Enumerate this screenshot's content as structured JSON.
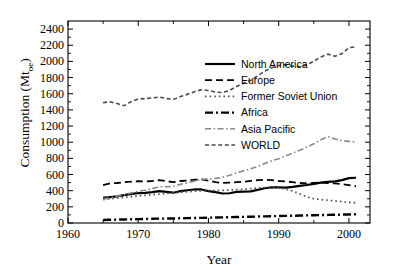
{
  "chart_data": {
    "type": "line",
    "title": "",
    "xlabel": "Year",
    "ylabel": "Consumption (Mtoe)",
    "ylabel_base": "Consumption (Mt",
    "ylabel_sub": "oe",
    "ylabel_close": ")",
    "xlim": [
      1960,
      2003
    ],
    "ylim": [
      0,
      2500
    ],
    "xticks": [
      1960,
      1970,
      1980,
      1990,
      2000
    ],
    "xticks_labels": [
      "1960",
      "1970",
      "1980",
      "1990",
      "2000"
    ],
    "xminor_step": 5,
    "yticks": [
      0,
      200,
      400,
      600,
      800,
      1000,
      1200,
      1400,
      1600,
      1800,
      2000,
      2200,
      2400
    ],
    "yticks_labels": [
      "0",
      "200",
      "400",
      "600",
      "800",
      "1000",
      "1200",
      "1400",
      "1600",
      "1800",
      "2000",
      "2200",
      "2400"
    ],
    "grid": false,
    "legend_position": "upper-right-inside",
    "x": [
      1965,
      1966,
      1967,
      1968,
      1969,
      1970,
      1971,
      1972,
      1973,
      1974,
      1975,
      1976,
      1977,
      1978,
      1979,
      1980,
      1981,
      1982,
      1983,
      1984,
      1985,
      1986,
      1987,
      1988,
      1989,
      1990,
      1991,
      1992,
      1993,
      1994,
      1995,
      1996,
      1997,
      1998,
      1999,
      2000,
      2001
    ],
    "series": [
      {
        "name": "North America",
        "style": "solid",
        "color": "#000000",
        "width": 2.2,
        "values": [
          310,
          320,
          330,
          345,
          360,
          370,
          372,
          382,
          395,
          385,
          375,
          395,
          405,
          415,
          415,
          395,
          382,
          365,
          368,
          385,
          388,
          392,
          410,
          430,
          440,
          440,
          438,
          448,
          460,
          470,
          485,
          500,
          510,
          515,
          530,
          555,
          560
        ]
      },
      {
        "name": "Europe",
        "style": "dashed",
        "color": "#000000",
        "width": 1.8,
        "values": [
          470,
          490,
          495,
          505,
          512,
          518,
          515,
          520,
          530,
          518,
          505,
          520,
          525,
          535,
          540,
          525,
          505,
          495,
          500,
          505,
          510,
          520,
          530,
          535,
          530,
          520,
          515,
          505,
          495,
          490,
          495,
          500,
          495,
          490,
          480,
          470,
          455
        ]
      },
      {
        "name": "Former Soviet Union",
        "style": "dotted",
        "color": "#555555",
        "width": 1.8,
        "values": [
          290,
          300,
          308,
          318,
          325,
          335,
          342,
          350,
          358,
          365,
          372,
          380,
          388,
          393,
          398,
          400,
          402,
          405,
          408,
          412,
          418,
          425,
          432,
          438,
          440,
          435,
          420,
          395,
          360,
          325,
          300,
          290,
          282,
          272,
          265,
          255,
          250
        ]
      },
      {
        "name": "Africa",
        "style": "dashdot",
        "color": "#000000",
        "width": 2.4,
        "values": [
          38,
          40,
          42,
          44,
          46,
          48,
          50,
          52,
          54,
          55,
          56,
          58,
          60,
          62,
          64,
          66,
          68,
          70,
          72,
          74,
          76,
          78,
          80,
          82,
          84,
          86,
          88,
          90,
          92,
          94,
          96,
          98,
          100,
          102,
          104,
          106,
          108
        ]
      },
      {
        "name": "Asia Pacific",
        "style": "dashdot",
        "color": "#8a8a8a",
        "width": 1.6,
        "values": [
          295,
          312,
          330,
          350,
          372,
          392,
          405,
          425,
          450,
          448,
          452,
          478,
          498,
          518,
          540,
          545,
          552,
          565,
          590,
          620,
          645,
          670,
          700,
          735,
          770,
          795,
          830,
          865,
          900,
          940,
          980,
          1030,
          1070,
          1040,
          1020,
          1010,
          1000
        ]
      },
      {
        "name": "WORLD",
        "style": "finedash",
        "color": "#4a4a4a",
        "width": 1.6,
        "values": [
          1490,
          1500,
          1478,
          1452,
          1502,
          1535,
          1540,
          1548,
          1560,
          1540,
          1530,
          1565,
          1592,
          1625,
          1650,
          1640,
          1620,
          1615,
          1640,
          1690,
          1730,
          1765,
          1820,
          1880,
          1920,
          1948,
          1960,
          1940,
          1935,
          1960,
          2000,
          2055,
          2090,
          2065,
          2095,
          2170,
          2180
        ]
      }
    ],
    "legend": [
      {
        "label": "North America",
        "style": "solid"
      },
      {
        "label": "Europe",
        "style": "dashed"
      },
      {
        "label": "Former Soviet Union",
        "style": "dotted"
      },
      {
        "label": "Africa",
        "style": "dashdot"
      },
      {
        "label": "Asia Pacific",
        "style": "dashdot-light"
      },
      {
        "label": "WORLD",
        "style": "finedash"
      }
    ]
  }
}
